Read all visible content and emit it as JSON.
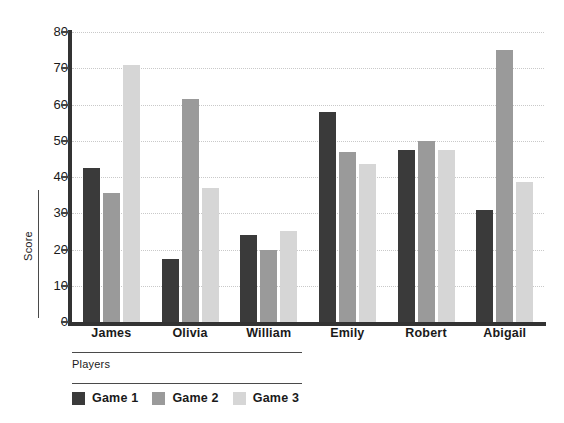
{
  "chart_data": {
    "type": "bar",
    "title": "",
    "xlabel": "Players",
    "ylabel": "Score",
    "ylim": [
      0,
      80
    ],
    "yticks": [
      0,
      10,
      20,
      30,
      40,
      50,
      60,
      70,
      80
    ],
    "grid": true,
    "legend_position": "bottom-left",
    "categories": [
      "James",
      "Olivia",
      "William",
      "Emily",
      "Robert",
      "Abigail"
    ],
    "series": [
      {
        "name": "Game 1",
        "color": "#3a3a3a",
        "values": [
          42.5,
          17.5,
          24,
          58,
          47.5,
          31
        ]
      },
      {
        "name": "Game 2",
        "color": "#9a9a9a",
        "values": [
          35.5,
          61.5,
          20,
          47,
          50,
          75
        ]
      },
      {
        "name": "Game 3",
        "color": "#d6d6d6",
        "values": [
          71,
          37,
          25,
          43.5,
          47.5,
          38.5
        ]
      }
    ]
  }
}
